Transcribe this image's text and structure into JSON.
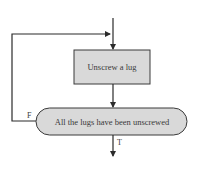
{
  "diagram": {
    "type": "flowchart",
    "colors": {
      "line": "#2b2b2b",
      "node_fill": "#d9d9d9",
      "node_stroke": "#3a3a3a",
      "text": "#3a3a3a",
      "background": "#ffffff"
    },
    "nodes": [
      {
        "id": "process",
        "shape": "rectangle",
        "label": "Unscrew a lug"
      },
      {
        "id": "decision",
        "shape": "rounded-pill",
        "label": "All the lugs have been unscrewed"
      }
    ],
    "edges": [
      {
        "from": "entry",
        "to": "process",
        "label": ""
      },
      {
        "from": "process",
        "to": "decision",
        "label": ""
      },
      {
        "from": "decision",
        "to": "process",
        "label": "F"
      },
      {
        "from": "decision",
        "to": "exit",
        "label": "T"
      }
    ],
    "labels": {
      "process": "Unscrew a lug",
      "decision": "All the lugs have been unscrewed",
      "false_branch": "F",
      "true_branch": "T"
    }
  }
}
